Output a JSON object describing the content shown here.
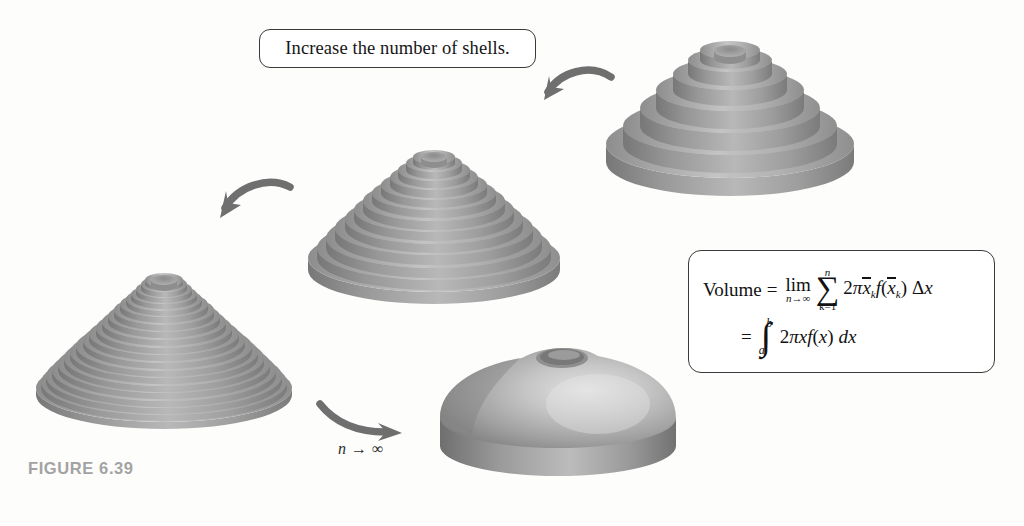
{
  "figure": {
    "caption": "FIGURE 6.39",
    "caption_color": "#a3a3a3"
  },
  "callouts": [
    {
      "id": "increase-shells",
      "text": "Increase the number of shells."
    }
  ],
  "annotations": {
    "limit_label_n": "n",
    "limit_label_arrow": "→",
    "limit_label_infinity": "∞"
  },
  "formula": {
    "line1": {
      "lhs": "Volume",
      "equals": "=",
      "lim": "lim",
      "lim_sub_n": "n",
      "lim_sub_arrow": "→",
      "lim_sub_inf": "∞",
      "sigma_glyph": "∑",
      "sigma_top": "n",
      "sigma_bottom": "k=1",
      "term_two": "2",
      "term_pi": "π",
      "term_xbar": "x",
      "term_sub_k": "k",
      "term_f": "f",
      "term_open": "(",
      "term_xbar2": "x",
      "term_sub_k2": "k",
      "term_close": ")",
      "term_delta": "Δ",
      "term_x": "x"
    },
    "line2": {
      "equals": "=",
      "integral_glyph": "∫",
      "upper_limit": "b",
      "lower_limit": "a",
      "integrand_two": "2",
      "integrand_pi": "π",
      "integrand_x": "x",
      "integrand_f": "f",
      "integrand_open": "(",
      "integrand_var": "x",
      "integrand_close": ")",
      "integrand_dx_d": "d",
      "integrand_dx_x": "x"
    }
  },
  "colors": {
    "shell_light": "#cfcfcf",
    "shell_mid": "#ababab",
    "shell_dark": "#8a8a8a",
    "shell_shadow": "#767676",
    "arrow": "#6f6f6f",
    "outline": "#3a3a3a",
    "background": "#fdfdfc"
  },
  "shapes": [
    {
      "id": "solid-stage-1",
      "name": "shell-solid-6-shells",
      "shell_count": 7,
      "position": {
        "left": 596,
        "top": 22
      },
      "size": {
        "width": 268,
        "height": 178
      }
    },
    {
      "id": "solid-stage-2",
      "name": "shell-solid-13-shells",
      "shell_count": 14,
      "position": {
        "left": 300,
        "top": 128
      },
      "size": {
        "width": 268,
        "height": 178
      }
    },
    {
      "id": "solid-stage-3",
      "name": "shell-solid-24-shells",
      "shell_count": 24,
      "position": {
        "left": 28,
        "top": 250
      },
      "size": {
        "width": 268,
        "height": 178
      }
    },
    {
      "id": "solid-stage-4",
      "name": "shell-solid-smooth-limit",
      "shell_count": 0,
      "position": {
        "left": 430,
        "top": 340
      },
      "size": {
        "width": 250,
        "height": 170
      }
    }
  ],
  "arrows": [
    {
      "id": "arrow-top",
      "name": "curved-arrow-stage1-to-stage2",
      "direction": "right-to-left"
    },
    {
      "id": "arrow-mid",
      "name": "curved-arrow-stage2-to-stage3",
      "direction": "right-to-left"
    },
    {
      "id": "arrow-bottom",
      "name": "curved-arrow-stage3-to-limit",
      "direction": "left-to-right",
      "label": "n → ∞"
    }
  ]
}
